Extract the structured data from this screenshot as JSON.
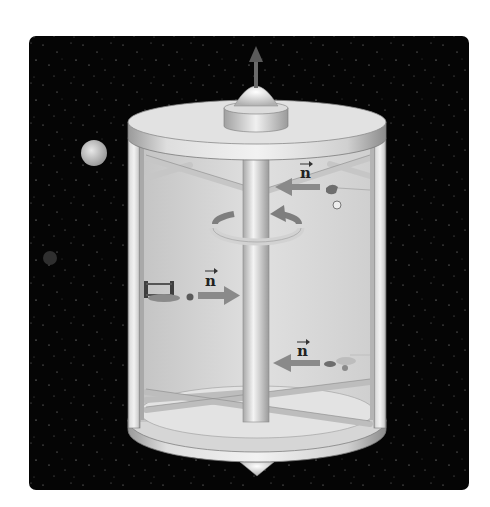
{
  "figure": {
    "background_color": "#050505",
    "station_color": "#d9d9d9",
    "vector_label": "n",
    "labels": [
      {
        "id": "normal-top-right",
        "text": "n",
        "direction": "left"
      },
      {
        "id": "normal-left",
        "text": "n",
        "direction": "right"
      },
      {
        "id": "normal-bottom-right",
        "text": "n",
        "direction": "left"
      }
    ],
    "rotation_axis_arrow": "up",
    "rotation_direction": "counterclockwise-viewed-from-top"
  }
}
